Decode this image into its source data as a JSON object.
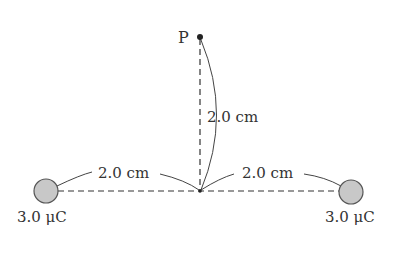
{
  "point": {
    "label": "P"
  },
  "distances": {
    "vertical": "2.0 cm",
    "left": "2.0 cm",
    "right": "2.0 cm"
  },
  "charges": [
    {
      "label": "3.0 μC",
      "position": "left"
    },
    {
      "label": "3.0 μC",
      "position": "right"
    }
  ],
  "colors": {
    "charge_fill": "#c8c8c8",
    "charge_stroke": "#555555",
    "line": "#333333"
  }
}
